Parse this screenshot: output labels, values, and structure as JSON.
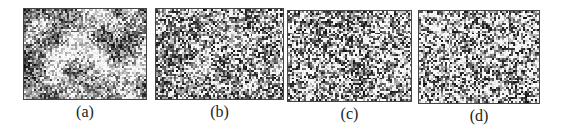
{
  "figure": {
    "panels": [
      {
        "label": "(a)",
        "x": 23,
        "y": 8,
        "w": 124,
        "h": 92,
        "seed": 11,
        "cluster": 0.55,
        "brightness": 0.52
      },
      {
        "label": "(b)",
        "x": 155,
        "y": 8,
        "w": 129,
        "h": 92,
        "seed": 23,
        "cluster": 0.3,
        "brightness": 0.5
      },
      {
        "label": "(c)",
        "x": 287,
        "y": 10,
        "w": 125,
        "h": 92,
        "seed": 37,
        "cluster": 0.2,
        "brightness": 0.52
      },
      {
        "label": "(d)",
        "x": 418,
        "y": 10,
        "w": 122,
        "h": 94,
        "seed": 51,
        "cluster": 0.12,
        "brightness": 0.55
      }
    ],
    "colors": {
      "border": "#444444",
      "label": "#222222",
      "background": "#ffffff"
    }
  }
}
